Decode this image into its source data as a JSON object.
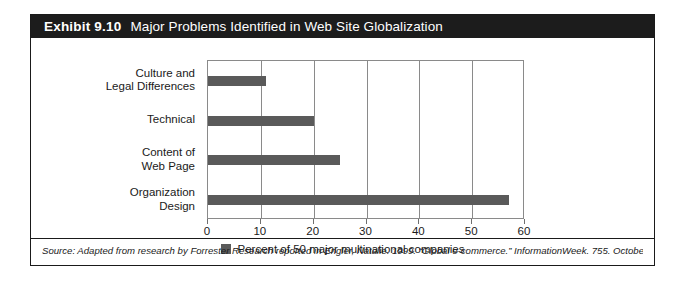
{
  "exhibit": {
    "number": "Exhibit 9.10",
    "title": "Major Problems Identified in Web Site Globalization",
    "source_note": "Source: Adapted from research by Forrester Research reported in Engler, Natalie. 1999. “Global e-commerce.” InformationWeek. 755. October 4."
  },
  "colors": {
    "bar": "#5a5a5a",
    "title_bar_bg": "#1c1c1c",
    "title_bar_text": "#ffffff",
    "frame": "#8a8a8a",
    "card_border": "#1a1a1a"
  },
  "legend": {
    "position": "bottom-center",
    "entries": [
      {
        "label": "Percent of 50 major multinational companies",
        "color": "#5a5a5a"
      }
    ]
  },
  "chart_data": {
    "type": "bar",
    "orientation": "horizontal",
    "title": "Major Problems Identified in Web Site Globalization",
    "subtitle": "",
    "xlabel": "",
    "ylabel": "",
    "categories": [
      "Culture and Legal Differences",
      "Technical",
      "Content of Web Page",
      "Organization Design"
    ],
    "category_lines": [
      [
        "Culture and",
        "Legal Differences"
      ],
      [
        "Technical"
      ],
      [
        "Content of",
        "Web Page"
      ],
      [
        "Organization",
        "Design"
      ]
    ],
    "series": [
      {
        "name": "Percent of 50 major multinational companies",
        "color": "#5a5a5a",
        "values": [
          11,
          20,
          25,
          57
        ]
      }
    ],
    "values": [
      11,
      20,
      25,
      57
    ],
    "xlim": [
      0,
      60
    ],
    "xticks": [
      0,
      10,
      20,
      30,
      40,
      50,
      60
    ],
    "xtick_labels": [
      "0",
      "10",
      "20",
      "30",
      "40",
      "50",
      "60"
    ],
    "grid": "vertical",
    "legend_position": "bottom-center"
  }
}
